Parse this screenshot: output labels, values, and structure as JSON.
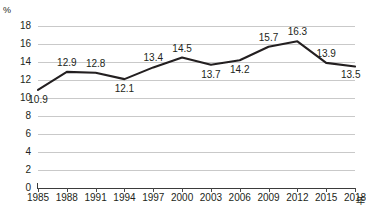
{
  "chart_data": {
    "type": "line",
    "title": "",
    "subtitle": "",
    "xlabel": "年",
    "ylabel": "%",
    "categories": [
      "1985",
      "1988",
      "1991",
      "1994",
      "1997",
      "2000",
      "2003",
      "2006",
      "2009",
      "2012",
      "2015",
      "2018"
    ],
    "x": [
      1985,
      1988,
      1991,
      1994,
      1997,
      2000,
      2003,
      2006,
      2009,
      2012,
      2015,
      2018
    ],
    "values": [
      10.9,
      12.9,
      12.8,
      12.1,
      13.4,
      14.5,
      13.7,
      14.2,
      15.7,
      16.3,
      13.9,
      13.5
    ],
    "point_labels": [
      "10.9",
      "12.9",
      "12.8",
      "12.1",
      "13.4",
      "14.5",
      "13.7",
      "14.2",
      "15.7",
      "16.3",
      "13.9",
      "13.5"
    ],
    "label_positions": [
      "below",
      "above",
      "above",
      "below",
      "above",
      "above",
      "below",
      "below",
      "above",
      "above",
      "above",
      "below-right"
    ],
    "ylim": [
      0,
      18
    ],
    "ytick_step": 2,
    "yticks": [
      "0",
      "2",
      "4",
      "6",
      "8",
      "10",
      "12",
      "14",
      "16",
      "18"
    ],
    "grid": true,
    "legend": false,
    "legend_position": "none",
    "series": [
      {
        "name": "",
        "values": [
          10.9,
          12.9,
          12.8,
          12.1,
          13.4,
          14.5,
          13.7,
          14.2,
          15.7,
          16.3,
          13.9,
          13.5
        ]
      }
    ],
    "colors": {
      "line": "#231f20",
      "grid": "#c9c9c9",
      "axis": "#3b3b3b",
      "text": "#231f20",
      "background": "#ffffff"
    }
  }
}
